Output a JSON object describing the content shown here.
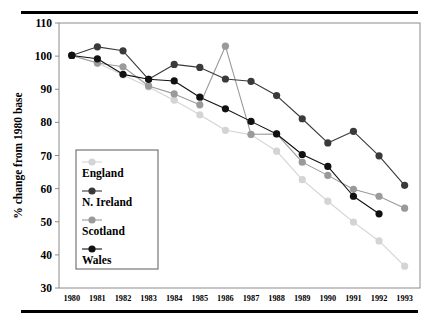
{
  "figure": {
    "title": "",
    "top_rule": "horizontal-rule",
    "bottom_rule": "horizontal-rule"
  },
  "chart_data": {
    "type": "line",
    "title": "",
    "subtitle": "",
    "xlabel": "",
    "ylabel": "% change from 1980 base",
    "x": [
      1980,
      1981,
      1982,
      1983,
      1984,
      1985,
      1986,
      1987,
      1988,
      1989,
      1990,
      1991,
      1992,
      1993
    ],
    "categories": [
      "1980",
      "1981",
      "1982",
      "1983",
      "1984",
      "1985",
      "1986",
      "1987",
      "1988",
      "1989",
      "1990",
      "1991",
      "1992",
      "1993"
    ],
    "xlim": [
      1979.5,
      1993.6
    ],
    "ylim": [
      30,
      110
    ],
    "yticks": [
      30,
      40,
      50,
      60,
      70,
      80,
      90,
      100,
      110
    ],
    "grid": false,
    "legend_position": "left-middle",
    "markers": "filled-circle",
    "series": [
      {
        "name": "England",
        "color": "#d4d4d4",
        "values": [
          100.2,
          97.9,
          94.3,
          90.7,
          86.7,
          82.3,
          77.6,
          76.3,
          71.3,
          62.7,
          56.2,
          49.9,
          44.2,
          36.6
        ]
      },
      {
        "name": "N. Ireland",
        "color": "#3a3a3a",
        "values": [
          100.2,
          102.8,
          101.6,
          93.0,
          97.5,
          96.6,
          93.1,
          92.4,
          88.1,
          81.1,
          73.8,
          77.3,
          69.9,
          61.0
        ]
      },
      {
        "name": "Scotland",
        "color": "#9a9a9a",
        "values": [
          100.2,
          97.9,
          96.8,
          91.0,
          88.6,
          85.3,
          103.0,
          76.4,
          76.5,
          68.0,
          64.0,
          59.8,
          57.7,
          54.1
        ]
      },
      {
        "name": "Wales",
        "color": "#111111",
        "values": [
          100.2,
          99.2,
          94.5,
          93.0,
          92.5,
          87.6,
          84.1,
          80.3,
          76.5,
          70.3,
          66.7,
          57.7,
          52.4,
          null
        ]
      }
    ]
  },
  "legend": {
    "entries": [
      {
        "label": "England",
        "marker": "circle-light-gray"
      },
      {
        "label": "N. Ireland",
        "marker": "circle-dark-gray"
      },
      {
        "label": "Scotland",
        "marker": "circle-mid-gray"
      },
      {
        "label": "Wales",
        "marker": "circle-black"
      }
    ]
  }
}
